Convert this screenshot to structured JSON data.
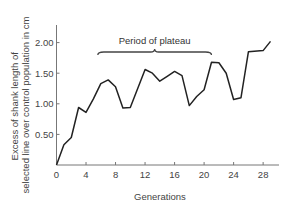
{
  "chart_data": {
    "type": "line",
    "title": "",
    "xlabel": "Generations",
    "ylabel_lines": [
      "Excess of shank length of",
      "selected line over control population in cm"
    ],
    "ylabel": "Excess of shank length of selected line over control population in cm",
    "x_ticks": [
      0,
      4,
      8,
      12,
      16,
      20,
      24,
      28
    ],
    "y_ticks": [
      0.5,
      1.0,
      1.5,
      2.0
    ],
    "y_tick_labels": [
      "0.50",
      "1.00",
      "1.50",
      "2.00"
    ],
    "xlim": [
      0,
      30
    ],
    "ylim": [
      0,
      2.25
    ],
    "grid": false,
    "legend": null,
    "series": [
      {
        "name": "Excess shank length",
        "x": [
          0,
          1,
          2,
          3,
          4,
          5,
          6,
          7,
          8,
          9,
          10,
          12,
          13,
          14,
          15,
          16,
          17,
          18,
          19,
          20,
          21,
          22,
          23,
          24,
          25,
          26,
          28,
          29
        ],
        "values": [
          0.0,
          0.33,
          0.45,
          0.94,
          0.86,
          1.08,
          1.33,
          1.39,
          1.28,
          0.93,
          0.94,
          1.56,
          1.5,
          1.37,
          1.45,
          1.53,
          1.46,
          0.97,
          1.12,
          1.23,
          1.68,
          1.67,
          1.5,
          1.07,
          1.1,
          1.85,
          1.87,
          2.02
        ]
      }
    ],
    "annotations": [
      {
        "text": "Period of plateau",
        "type": "brace",
        "x_start": 5.6,
        "x_end": 21.0,
        "y": 1.85
      }
    ]
  }
}
